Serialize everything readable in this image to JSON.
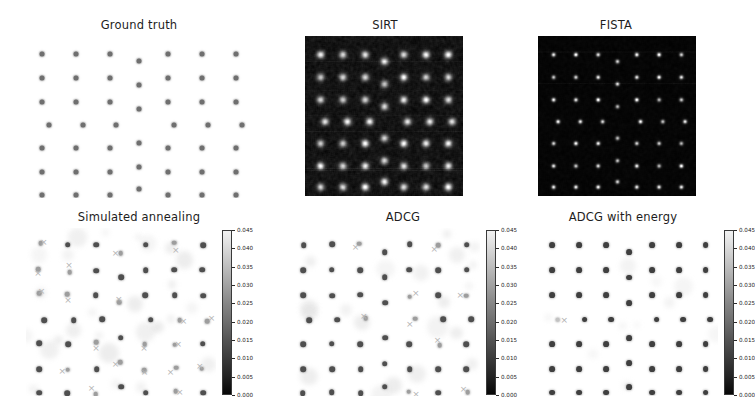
{
  "figure": {
    "background": "#ffffff",
    "title_color": "#1d1d1d",
    "marker_color": "#6f6f6f",
    "xmarker_color": "#b4b4b4",
    "dark_bg": "#050505"
  },
  "colorbar": {
    "ticks": [
      "0.045",
      "0.040",
      "0.035",
      "0.030",
      "0.025",
      "0.020",
      "0.015",
      "0.010",
      "0.005",
      "0.000"
    ],
    "vmin": 0.0,
    "vmax": 0.045,
    "cmap": "gray",
    "orientation": "vertical"
  },
  "panels": [
    {
      "id": "ground-truth",
      "title": "Ground truth",
      "type": "scatter",
      "colorbar": false
    },
    {
      "id": "sirt",
      "title": "SIRT",
      "type": "image",
      "colorbar": false
    },
    {
      "id": "fista",
      "title": "FISTA",
      "type": "image",
      "colorbar": false
    },
    {
      "id": "simulated-annealing",
      "title": "Simulated annealing",
      "type": "scatter",
      "colorbar": true
    },
    {
      "id": "adcg",
      "title": "ADCG",
      "type": "scatter",
      "colorbar": true
    },
    {
      "id": "adcg-with-energy",
      "title": "ADCG with energy",
      "type": "scatter",
      "colorbar": true
    }
  ],
  "chart_data": {
    "type": "scatter",
    "xlabel": "",
    "ylabel": "",
    "grid": false,
    "legend": [
      {
        "label": "recovered atom",
        "marker": "o"
      },
      {
        "label": "ground truth atom",
        "marker": "x"
      }
    ],
    "lattice": {
      "rows": 7,
      "cols": 7,
      "defect_column_index": 3,
      "description": "Regular 7x7 grid of atomic columns; the fourth column is vertically offset forming a grain boundary, and row 4 is laterally shifted and missing the defect-column atom."
    },
    "panels": [
      {
        "name": "Ground truth",
        "kind": "scatter",
        "points": [
          [
            0.07,
            0.1
          ],
          [
            0.22,
            0.1
          ],
          [
            0.37,
            0.1
          ],
          [
            0.5,
            0.145
          ],
          [
            0.63,
            0.1
          ],
          [
            0.78,
            0.1
          ],
          [
            0.93,
            0.1
          ],
          [
            0.07,
            0.25
          ],
          [
            0.22,
            0.25
          ],
          [
            0.37,
            0.25
          ],
          [
            0.5,
            0.295
          ],
          [
            0.63,
            0.25
          ],
          [
            0.78,
            0.25
          ],
          [
            0.93,
            0.25
          ],
          [
            0.07,
            0.4
          ],
          [
            0.22,
            0.4
          ],
          [
            0.37,
            0.4
          ],
          [
            0.5,
            0.445
          ],
          [
            0.63,
            0.4
          ],
          [
            0.78,
            0.4
          ],
          [
            0.93,
            0.4
          ],
          [
            0.1,
            0.545
          ],
          [
            0.25,
            0.545
          ],
          [
            0.4,
            0.545
          ],
          [
            0.655,
            0.545
          ],
          [
            0.805,
            0.545
          ],
          [
            0.955,
            0.545
          ],
          [
            0.07,
            0.69
          ],
          [
            0.22,
            0.69
          ],
          [
            0.37,
            0.69
          ],
          [
            0.5,
            0.655
          ],
          [
            0.63,
            0.69
          ],
          [
            0.78,
            0.69
          ],
          [
            0.93,
            0.69
          ],
          [
            0.07,
            0.84
          ],
          [
            0.22,
            0.84
          ],
          [
            0.37,
            0.84
          ],
          [
            0.5,
            0.805
          ],
          [
            0.63,
            0.84
          ],
          [
            0.78,
            0.84
          ],
          [
            0.93,
            0.84
          ],
          [
            0.07,
            0.98
          ],
          [
            0.22,
            0.98
          ],
          [
            0.37,
            0.98
          ],
          [
            0.5,
            0.945
          ],
          [
            0.63,
            0.98
          ],
          [
            0.78,
            0.98
          ],
          [
            0.93,
            0.98
          ]
        ]
      },
      {
        "name": "SIRT",
        "kind": "image",
        "note": "Blurry grayscale reconstruction, high background noise, broad low-contrast peaks at each atomic column"
      },
      {
        "name": "FISTA",
        "kind": "image",
        "note": "Sparse grayscale reconstruction, dark background, compact bright peaks at each atomic column"
      },
      {
        "name": "Simulated annealing",
        "kind": "scatter",
        "note": "Recovered positions (dots) with many mismatched ground-truth markers (x), largest localization error of the point-source methods"
      },
      {
        "name": "ADCG",
        "kind": "scatter",
        "note": "Recovered positions (dots) with fewer mismatched ground-truth markers (x) than simulated annealing"
      },
      {
        "name": "ADCG with energy",
        "kind": "scatter",
        "note": "Recovered positions match ground truth almost everywhere; a single mismatched marker (x) at the left of row 4"
      }
    ]
  }
}
